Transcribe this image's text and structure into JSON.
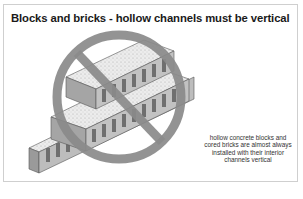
{
  "figure": {
    "title": "Blocks and bricks - hollow channels must be vertical",
    "caption_lines": [
      "hollow concrete blocks and",
      "cored bricks are almost always",
      "installed with their interior",
      "channels vertical"
    ],
    "footer_text": "....",
    "symbol": "prohibition-sign",
    "colors": {
      "prohibition": "#8a8a8a",
      "block_face": "#e6e6e6",
      "block_shadow": "#9a9a9a",
      "border": "#cfcfcf"
    }
  }
}
